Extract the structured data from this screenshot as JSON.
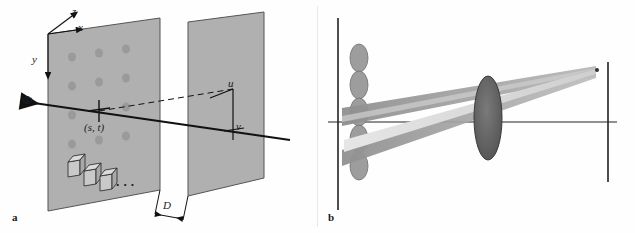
{
  "figure": {
    "panels": [
      {
        "id": "a",
        "tag": "a",
        "name": "two-plane-light-field-parameterization",
        "labels": [
          {
            "id": "axis_z",
            "text": "z"
          },
          {
            "id": "axis_x",
            "text": "x"
          },
          {
            "id": "axis_y",
            "text": "y"
          },
          {
            "id": "ray",
            "text": "Φ"
          },
          {
            "id": "st_point",
            "text": "(s, t)"
          },
          {
            "id": "u_coord",
            "text": "u"
          },
          {
            "id": "v_coord",
            "text": "v"
          },
          {
            "id": "distance",
            "text": "D"
          },
          {
            "id": "ellipsis",
            "text": "• • •"
          }
        ],
        "colors": {
          "plane_fill": "#b3b3b3",
          "plane_stroke": "#4d4d4d",
          "ray_line": "#111111",
          "dot": "#9a9a9a",
          "cube_face": "#cccccc"
        }
      },
      {
        "id": "b",
        "tag": "b",
        "name": "lens-array-light-cone-schematic",
        "labels": [],
        "colors": {
          "lens_fill": "#8c8c8c",
          "cone_fill": "#9e9e9e",
          "beam_highlight": "#d8d8d8",
          "axis_line": "#222222"
        }
      }
    ]
  }
}
